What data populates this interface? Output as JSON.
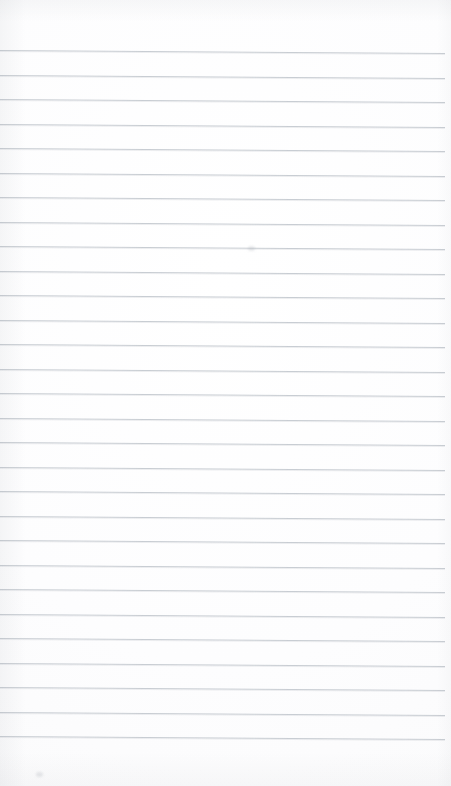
{
  "document": {
    "type": "scanned-page",
    "title": "",
    "content_text": "",
    "is_blank": true,
    "description": "Blank ruled notebook page (scanned). No handwriting, print, headings, or marks present.",
    "page_number": ""
  },
  "canvas": {
    "width_px": 451,
    "height_px": 786
  },
  "paper": {
    "background_color": "#fefefe",
    "tint_color": "#fafafb",
    "edge_shadow_color": "#969ba2"
  },
  "ruling": {
    "line_color": "#c6cbd1",
    "line_thickness_px": 1,
    "line_spacing_px": 24.5,
    "first_line_y_px": 50,
    "last_line_y_px": 736,
    "line_count": 29,
    "left_margin_px": 0,
    "right_margin_px": 6,
    "skew_degrees": 0.38,
    "line_start_x_px": 0,
    "line_end_x_px": 445,
    "margin_rule_present": false,
    "header_rule_present": false,
    "line_y_positions": [
      50,
      74.5,
      99,
      123.5,
      148,
      172.5,
      197,
      221.5,
      246,
      270.5,
      295,
      319.5,
      344,
      368.5,
      393,
      417.5,
      442,
      466.5,
      491,
      515.5,
      540,
      564.5,
      589,
      613.5,
      638,
      662.5,
      687,
      711.5,
      736
    ]
  },
  "artifacts": {
    "specks": [
      {
        "x_px": 248,
        "y_px": 246
      },
      {
        "x_px": 36,
        "y_px": 772
      }
    ]
  }
}
